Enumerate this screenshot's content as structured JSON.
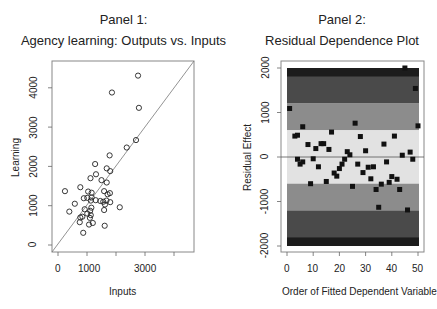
{
  "chart_data": [
    {
      "type": "scatter",
      "panel_label": "Panel 1:",
      "title": "Agency learning: Outputs vs. Inputs",
      "xlabel": "Inputs",
      "ylabel": "Learning",
      "xticks": [
        0,
        1000,
        3000
      ],
      "xticks_all": [
        0,
        1000,
        2000,
        3000,
        4000
      ],
      "yticks": [
        0,
        1000,
        2000,
        3000,
        4000
      ],
      "xlim": [
        -200,
        4700
      ],
      "ylim": [
        -180,
        4700
      ],
      "reference_line": "y = x",
      "marker": "open-circle",
      "grid": false,
      "points": [
        {
          "x": 2760,
          "y": 4310
        },
        {
          "x": 1860,
          "y": 3880
        },
        {
          "x": 2790,
          "y": 3490
        },
        {
          "x": 2690,
          "y": 2670
        },
        {
          "x": 2370,
          "y": 2480
        },
        {
          "x": 1780,
          "y": 2280
        },
        {
          "x": 1280,
          "y": 2060
        },
        {
          "x": 1800,
          "y": 1880
        },
        {
          "x": 1680,
          "y": 1950
        },
        {
          "x": 1310,
          "y": 1800
        },
        {
          "x": 1120,
          "y": 1700
        },
        {
          "x": 1500,
          "y": 1650
        },
        {
          "x": 1680,
          "y": 1590
        },
        {
          "x": 240,
          "y": 1370
        },
        {
          "x": 770,
          "y": 1470
        },
        {
          "x": 1040,
          "y": 1360
        },
        {
          "x": 1160,
          "y": 1330
        },
        {
          "x": 1590,
          "y": 1370
        },
        {
          "x": 1790,
          "y": 1320
        },
        {
          "x": 1710,
          "y": 1290
        },
        {
          "x": 890,
          "y": 1190
        },
        {
          "x": 1010,
          "y": 1200
        },
        {
          "x": 1160,
          "y": 1210
        },
        {
          "x": 1300,
          "y": 1140
        },
        {
          "x": 1460,
          "y": 1120
        },
        {
          "x": 1560,
          "y": 1100
        },
        {
          "x": 1670,
          "y": 1130
        },
        {
          "x": 1800,
          "y": 1090
        },
        {
          "x": 1130,
          "y": 1130
        },
        {
          "x": 580,
          "y": 1050
        },
        {
          "x": 1620,
          "y": 1030
        },
        {
          "x": 2130,
          "y": 960
        },
        {
          "x": 1150,
          "y": 950
        },
        {
          "x": 920,
          "y": 910
        },
        {
          "x": 390,
          "y": 850
        },
        {
          "x": 1110,
          "y": 870
        },
        {
          "x": 1590,
          "y": 890
        },
        {
          "x": 1010,
          "y": 800
        },
        {
          "x": 1130,
          "y": 760
        },
        {
          "x": 840,
          "y": 720
        },
        {
          "x": 770,
          "y": 700
        },
        {
          "x": 1100,
          "y": 690
        },
        {
          "x": 750,
          "y": 580
        },
        {
          "x": 1200,
          "y": 560
        },
        {
          "x": 1070,
          "y": 520
        },
        {
          "x": 1610,
          "y": 490
        },
        {
          "x": 870,
          "y": 310
        }
      ]
    },
    {
      "type": "scatter",
      "panel_label": "Panel 2:",
      "title": "Residual Dependence Plot",
      "xlabel": "Order of Fitted Dependent Variable",
      "ylabel": "Residual Effect",
      "xticks": [
        0,
        10,
        20,
        30,
        40,
        50
      ],
      "yticks": [
        -2000,
        -1000,
        0,
        1000,
        2000
      ],
      "xlim": [
        -2,
        52
      ],
      "ylim": [
        -2150,
        2150
      ],
      "reference_line": "y = 0",
      "marker": "filled-square",
      "grid": false,
      "bands": [
        {
          "from": 1800,
          "to": 2000,
          "color": "#1c1c1c"
        },
        {
          "from": 1200,
          "to": 1800,
          "color": "#4a4a4a"
        },
        {
          "from": 600,
          "to": 1200,
          "color": "#8c8c8c"
        },
        {
          "from": -600,
          "to": 600,
          "color": "#e2e2e2"
        },
        {
          "from": -1200,
          "to": -600,
          "color": "#8c8c8c"
        },
        {
          "from": -1800,
          "to": -1200,
          "color": "#4a4a4a"
        },
        {
          "from": -2000,
          "to": -1800,
          "color": "#1c1c1c"
        }
      ],
      "points": [
        {
          "x": 1,
          "y": 1090
        },
        {
          "x": 3,
          "y": 470
        },
        {
          "x": 4,
          "y": 490
        },
        {
          "x": 4,
          "y": -50
        },
        {
          "x": 5,
          "y": -160
        },
        {
          "x": 6,
          "y": -110
        },
        {
          "x": 6,
          "y": 680
        },
        {
          "x": 8,
          "y": 280
        },
        {
          "x": 9,
          "y": -600
        },
        {
          "x": 10,
          "y": -40
        },
        {
          "x": 11,
          "y": 190
        },
        {
          "x": 12,
          "y": -220
        },
        {
          "x": 13,
          "y": 300
        },
        {
          "x": 14,
          "y": 300
        },
        {
          "x": 15,
          "y": -550
        },
        {
          "x": 16,
          "y": 170
        },
        {
          "x": 17,
          "y": 560
        },
        {
          "x": 18,
          "y": -360
        },
        {
          "x": 19,
          "y": -430
        },
        {
          "x": 20,
          "y": -260
        },
        {
          "x": 21,
          "y": -160
        },
        {
          "x": 22,
          "y": -50
        },
        {
          "x": 23,
          "y": 120
        },
        {
          "x": 24,
          "y": 50
        },
        {
          "x": 25,
          "y": -660
        },
        {
          "x": 26,
          "y": 760
        },
        {
          "x": 27,
          "y": -160
        },
        {
          "x": 28,
          "y": 460
        },
        {
          "x": 29,
          "y": -350
        },
        {
          "x": 30,
          "y": 140
        },
        {
          "x": 31,
          "y": -230
        },
        {
          "x": 32,
          "y": -490
        },
        {
          "x": 33,
          "y": -220
        },
        {
          "x": 34,
          "y": -730
        },
        {
          "x": 35,
          "y": -1130
        },
        {
          "x": 36,
          "y": -610
        },
        {
          "x": 37,
          "y": 290
        },
        {
          "x": 38,
          "y": -110
        },
        {
          "x": 39,
          "y": -570
        },
        {
          "x": 40,
          "y": -440
        },
        {
          "x": 41,
          "y": 470
        },
        {
          "x": 42,
          "y": -500
        },
        {
          "x": 43,
          "y": -730
        },
        {
          "x": 44,
          "y": 40
        },
        {
          "x": 46,
          "y": -1190
        },
        {
          "x": 45,
          "y": 2000
        },
        {
          "x": 47,
          "y": 110
        },
        {
          "x": 48,
          "y": -50
        },
        {
          "x": 49,
          "y": 1540
        },
        {
          "x": 50,
          "y": 700
        }
      ]
    }
  ],
  "panel1": {
    "label": "Panel 1:",
    "title": "Agency learning: Outputs vs. Inputs",
    "xlabel": "Inputs",
    "ylabel": "Learning",
    "xtick_labels": [
      "0",
      "1000",
      "3000"
    ],
    "ytick_labels": [
      "0",
      "1000",
      "2000",
      "3000",
      "4000"
    ]
  },
  "panel2": {
    "label": "Panel 2:",
    "title": "Residual Dependence Plot",
    "xlabel": "Order of Fitted Dependent Variable",
    "ylabel": "Residual Effect",
    "xtick_labels": [
      "0",
      "10",
      "20",
      "30",
      "40",
      "50"
    ],
    "ytick_labels": [
      "-2000",
      "-1000",
      "0",
      "1000",
      "2000"
    ]
  }
}
